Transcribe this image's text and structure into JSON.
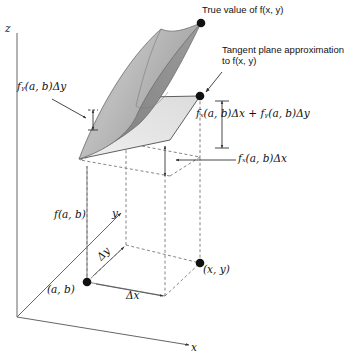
{
  "figure": {
    "background": "#ffffff",
    "axes": {
      "z_label": "z",
      "y_label": "y",
      "x_label": "x"
    },
    "annotations": {
      "true_value": "True value of f(x, y)",
      "tangent_plane_line1": "Tangent plane approximation",
      "tangent_plane_line2": "to f(x, y)",
      "increment_sum": "fₓ(a, b)Δx + fᵧ(a, b)Δy",
      "fx_dx": "fₓ(a, b)Δx",
      "fy_dy": "fᵧ(a, b)Δy",
      "f_at_ab": "f(a, b)",
      "point_ab": "(a, b)",
      "point_xy": "(x, y)",
      "delta_x": "Δx",
      "delta_y": "Δy"
    },
    "colors": {
      "surface_top": "#b6b6b6",
      "surface_under": "#8b8b8b",
      "surface_edge": "#6f6f6f",
      "tangent_plane": "#e3e3e3",
      "tangent_edge": "#5a5a5a",
      "dashed": "#6b6b6b",
      "axis": "#555555",
      "dot": "#111111",
      "text": "#111111"
    },
    "points": {
      "true_value_dot": [
        201,
        23
      ],
      "tangent_dot": [
        200,
        96
      ],
      "ab_dot": [
        87,
        282
      ],
      "xy_dot": [
        200,
        263
      ]
    }
  }
}
